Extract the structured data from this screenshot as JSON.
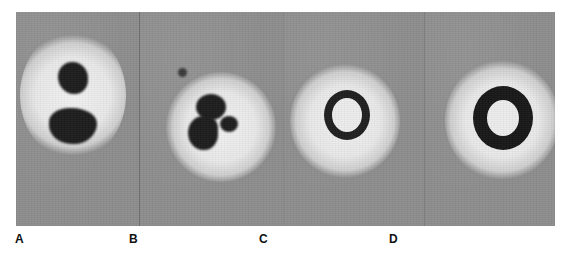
{
  "figure": {
    "background_color": "#8e8e8e",
    "panels": [
      {
        "label": "A",
        "content": "two dark irregular nuclear masses stacked vertically within a bright halo"
      },
      {
        "label": "B",
        "content": "multilobed dark cell within bright halo, small dark particle to upper left"
      },
      {
        "label": "C",
        "content": "thin dark ring with bright center within bright halo"
      },
      {
        "label": "D",
        "content": "thick dark ring with bright center within bright halo"
      }
    ]
  }
}
